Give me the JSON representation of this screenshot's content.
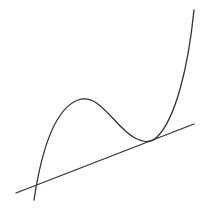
{
  "diagram": {
    "colors": {
      "background": "#ffffff",
      "stroke": "#333333"
    },
    "curve": {
      "type": "cubic-function",
      "start": [
        34,
        200
      ],
      "local_max": [
        78,
        100
      ],
      "tangent_point": [
        148,
        141
      ],
      "end": [
        194,
        10
      ]
    },
    "tangent_line": {
      "start": [
        16,
        193
      ],
      "end": [
        194,
        124
      ],
      "intersection_with_curve": [
        36,
        184
      ]
    }
  }
}
